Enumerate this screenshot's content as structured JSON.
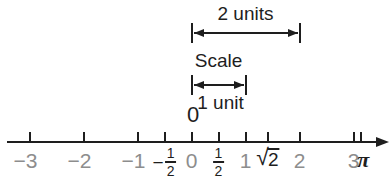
{
  "figure": {
    "background": "#ffffff",
    "ink_color": "#1e1e1e",
    "muted_color": "#8d8d8d"
  },
  "annotations": {
    "two_units": {
      "label": "2 units",
      "from_value": 0,
      "to_value": 2
    },
    "scale": {
      "title": "Scale",
      "label": "1 unit",
      "from_value": 0,
      "to_value": 1
    },
    "origin_label": "0"
  },
  "number_line": {
    "ticks": [
      {
        "value": -3,
        "kind": "plain",
        "text": "−3",
        "style": "muted"
      },
      {
        "value": -2,
        "kind": "plain",
        "text": "−2",
        "style": "muted"
      },
      {
        "value": -1,
        "kind": "plain",
        "text": "−1",
        "style": "muted"
      },
      {
        "value": -0.5,
        "kind": "fraction",
        "sign": "−",
        "numerator": "1",
        "denominator": "2",
        "style": "ink"
      },
      {
        "value": 0,
        "kind": "plain",
        "text": "0",
        "style": "muted"
      },
      {
        "value": 0.5,
        "kind": "fraction",
        "sign": "",
        "numerator": "1",
        "denominator": "2",
        "style": "ink"
      },
      {
        "value": 1,
        "kind": "plain",
        "text": "1",
        "style": "muted"
      },
      {
        "value": 1.4142,
        "kind": "sqrt",
        "radicand": "2",
        "style": "ink"
      },
      {
        "value": 2,
        "kind": "plain",
        "text": "2",
        "style": "muted"
      },
      {
        "value": 3,
        "kind": "plain",
        "text": "3",
        "style": "muted"
      },
      {
        "value": 3.1416,
        "kind": "pi",
        "text": "π",
        "style": "ink"
      }
    ]
  }
}
